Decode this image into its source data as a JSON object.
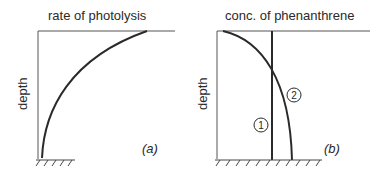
{
  "panels": [
    {
      "id": "a",
      "title": "rate of photolysis",
      "ylabel": "depth",
      "tag": "(a)",
      "curves": [
        {
          "label": "",
          "description": "rate increases from near zero at depth to maximum at surface (concave curve)"
        }
      ]
    },
    {
      "id": "b",
      "title": "conc. of phenanthrene",
      "ylabel": "depth",
      "tag": "(b)",
      "curves": [
        {
          "label": "1",
          "description": "constant concentration with depth (vertical line)"
        },
        {
          "label": "2",
          "description": "concentration low at surface, increasing with depth"
        }
      ]
    }
  ],
  "colors": {
    "line": "#2a2a2a",
    "background": "#ffffff"
  }
}
